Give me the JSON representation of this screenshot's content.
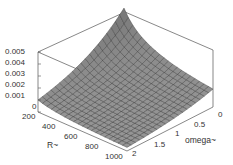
{
  "chart_data": {
    "type": "surface3d",
    "title": "",
    "xlabel": "R",
    "ylabel": "omega",
    "zlabel": "",
    "x_axis": {
      "label": "R~",
      "range": [
        200,
        1000
      ],
      "ticks": [
        "200",
        "400",
        "600",
        "800",
        "1000"
      ]
    },
    "y_axis": {
      "label": "omega~",
      "range": [
        0,
        2
      ],
      "ticks": [
        "0",
        "0.5",
        "1",
        "1.5",
        "2"
      ]
    },
    "z_axis": {
      "range": [
        0,
        0.005
      ],
      "ticks": [
        "0",
        "0.001",
        "0.002",
        "0.003",
        "0.004",
        "0.005"
      ]
    },
    "samples": [
      {
        "R": 200,
        "omega": 0,
        "z": 0.005
      },
      {
        "R": 200,
        "omega": 0.5,
        "z": 0.0035
      },
      {
        "R": 200,
        "omega": 1,
        "z": 0.0022
      },
      {
        "R": 200,
        "omega": 2,
        "z": 0.0008
      },
      {
        "R": 400,
        "omega": 0,
        "z": 0.0025
      },
      {
        "R": 600,
        "omega": 0,
        "z": 0.0017
      },
      {
        "R": 1000,
        "omega": 0,
        "z": 0.001
      },
      {
        "R": 1000,
        "omega": 2,
        "z": 0.0
      }
    ],
    "grid": false,
    "colormap": "gray"
  },
  "axes": {
    "z_ticks": [
      "0.005",
      "0.004",
      "0.003",
      "0.002",
      "0.001",
      "0"
    ],
    "r_ticks": [
      "200",
      "400",
      "600",
      "800",
      "1000"
    ],
    "omega_ticks": [
      "0",
      "0.5",
      "1",
      "1.5",
      "2"
    ],
    "r_label": "R~",
    "omega_label": "omega~"
  }
}
